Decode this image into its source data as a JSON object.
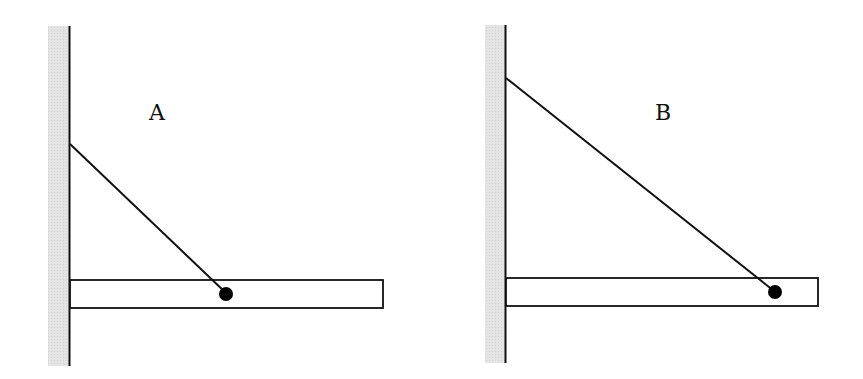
{
  "figure": {
    "colors": {
      "wall_fill": "#e2e2e2",
      "line": "#111111",
      "background": "#ffffff"
    },
    "panels": [
      {
        "id": "A",
        "label": "A",
        "wire_anchor_on_beam": "middle of beam",
        "wire_attachment_on_wall": "lower"
      },
      {
        "id": "B",
        "label": "B",
        "wire_anchor_on_beam": "near end of beam",
        "wire_attachment_on_wall": "higher"
      }
    ]
  }
}
